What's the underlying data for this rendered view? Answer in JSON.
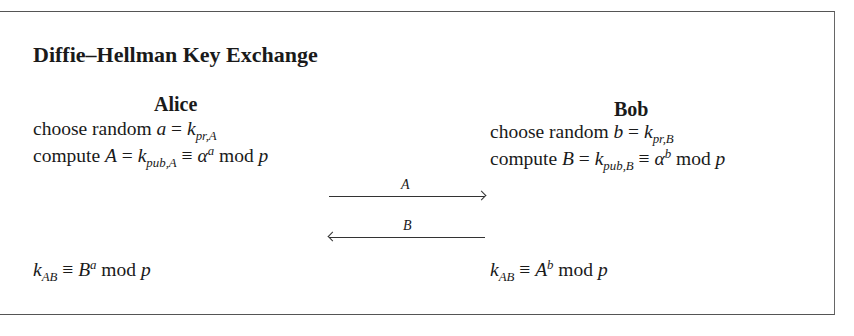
{
  "title": "Diffie–Hellman Key Exchange",
  "alice": {
    "name": "Alice",
    "line1": {
      "text": "choose random ",
      "var": "a",
      "eq": " = ",
      "k": "k",
      "sub": "pr,A"
    },
    "line2": {
      "text": "compute ",
      "var": "A",
      "eq": " = ",
      "k": "k",
      "sub": "pub,A",
      "cong": " ≡ ",
      "alpha": "α",
      "sup": "a",
      "mod": " mod ",
      "p": "p"
    },
    "result": {
      "k": "k",
      "sub": "AB",
      "cong": " ≡ ",
      "base": "B",
      "sup": "a",
      "mod": " mod ",
      "p": "p"
    }
  },
  "bob": {
    "name": "Bob",
    "line1": {
      "text": "choose random ",
      "var": "b",
      "eq": " = ",
      "k": "k",
      "sub": "pr,B"
    },
    "line2": {
      "text": "compute ",
      "var": "B",
      "eq": " = ",
      "k": "k",
      "sub": "pub,B",
      "cong": " ≡ ",
      "alpha": "α",
      "sup": "b",
      "mod": " mod ",
      "p": "p"
    },
    "result": {
      "k": "k",
      "sub": "AB",
      "cong": " ≡ ",
      "base": "A",
      "sup": "b",
      "mod": " mod ",
      "p": "p"
    }
  },
  "messages": [
    {
      "label": "A",
      "direction": "alice-to-bob"
    },
    {
      "label": "B",
      "direction": "bob-to-alice"
    }
  ]
}
